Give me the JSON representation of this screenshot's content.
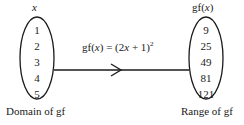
{
  "domain": {
    "header": "x",
    "values": [
      "1",
      "2",
      "3",
      "4",
      "5"
    ],
    "caption": "Domain of gf"
  },
  "range": {
    "header_fn": "gf(",
    "header_var": "x",
    "header_close": ")",
    "values": [
      "9",
      "25",
      "49",
      "81",
      "121"
    ],
    "caption": "Range of gf"
  },
  "mapping": {
    "lhs_fn": "gf(",
    "lhs_var": "x",
    "lhs_close": ") = (2",
    "rhs_var": "x",
    "rhs_rest": " + 1)",
    "exponent": "2"
  },
  "colors": {
    "stroke": "#1a1a1a",
    "background": "#ffffff"
  }
}
